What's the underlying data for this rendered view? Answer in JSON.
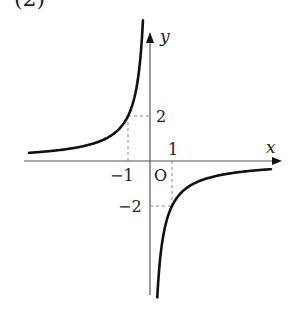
{
  "header": {
    "label": "(2)"
  },
  "chart_data": {
    "type": "line",
    "title": "",
    "function": "y = -2/x",
    "xlabel": "x",
    "ylabel": "y",
    "origin_label": "O",
    "x_ticks": [
      {
        "value": -1,
        "label": "−1"
      },
      {
        "value": 1,
        "label": "1"
      }
    ],
    "y_ticks": [
      {
        "value": 2,
        "label": "2"
      },
      {
        "value": -2,
        "label": "−2"
      }
    ],
    "marked_points": [
      {
        "x": -1,
        "y": 2
      },
      {
        "x": 1,
        "y": -2
      }
    ],
    "series": [
      {
        "name": "left branch",
        "x": [
          -5.5,
          -4,
          -3,
          -2,
          -1.5,
          -1,
          -0.75,
          -0.5,
          -0.4,
          -0.32
        ],
        "y": [
          0.36,
          0.5,
          0.67,
          1,
          1.33,
          2,
          2.67,
          4,
          5,
          6.25
        ]
      },
      {
        "name": "right branch",
        "x": [
          0.33,
          0.4,
          0.5,
          0.75,
          1,
          1.5,
          2,
          3,
          4,
          5.5
        ],
        "y": [
          -6.0,
          -5,
          -4,
          -2.67,
          -2,
          -1.33,
          -1,
          -0.67,
          -0.5,
          -0.36
        ]
      }
    ],
    "xlim": [
      -5.6,
      5.6
    ],
    "ylim": [
      -6.2,
      5.5
    ],
    "grid": false,
    "dashed_guides": true
  }
}
